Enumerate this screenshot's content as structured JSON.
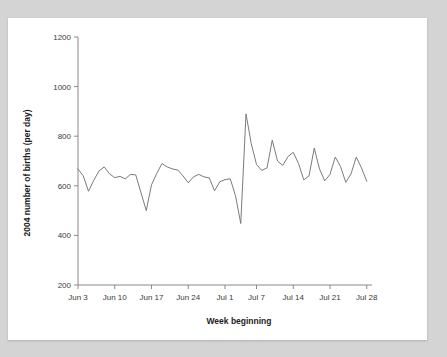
{
  "page": {
    "background_color": "#d4d4d4",
    "card_color": "#ffffff"
  },
  "chart_data": {
    "type": "line",
    "title": "",
    "subtitle": "",
    "xlabel": "Week beginning",
    "ylabel": "2004 number of births (per day)",
    "xlim": [
      0,
      56
    ],
    "ylim": [
      200,
      1200
    ],
    "grid": false,
    "legend": null,
    "line_color": "#7b7b7b",
    "axis_color": "#8a8a8a",
    "y_ticks": [
      200,
      400,
      600,
      800,
      1000,
      1200
    ],
    "y_tick_labels": [
      "200",
      "400",
      "600",
      "800",
      "1000",
      "1200"
    ],
    "x_ticks": [
      0,
      7,
      14,
      21,
      28,
      34,
      41,
      48,
      55
    ],
    "x_tick_labels": [
      "Jun 3",
      "Jun 10",
      "Jun 17",
      "Jun 24",
      "Jul 1",
      "Jul 7",
      "Jul 14",
      "Jul 21",
      "Jul 28"
    ],
    "x": [
      0,
      1,
      2,
      3,
      4,
      5,
      6,
      7,
      8,
      9,
      10,
      11,
      12,
      13,
      14,
      15,
      16,
      17,
      18,
      19,
      20,
      21,
      22,
      23,
      24,
      25,
      26,
      27,
      28,
      29,
      30,
      31,
      32,
      33,
      34,
      35,
      36,
      37,
      38,
      39,
      40,
      41,
      42,
      43,
      44,
      45,
      46,
      47,
      48,
      49,
      50,
      51,
      52,
      53,
      54,
      55
    ],
    "values": [
      668,
      640,
      578,
      622,
      660,
      676,
      648,
      633,
      638,
      628,
      646,
      644,
      572,
      500,
      604,
      650,
      690,
      676,
      668,
      664,
      640,
      612,
      636,
      646,
      636,
      632,
      580,
      616,
      625,
      628,
      560,
      448,
      890,
      770,
      686,
      662,
      672,
      784,
      700,
      682,
      718,
      735,
      690,
      624,
      640,
      752,
      668,
      620,
      646,
      716,
      678,
      614,
      648,
      716,
      672,
      618
    ]
  },
  "icons": {
    "chart_icon": "line-chart-icon"
  }
}
